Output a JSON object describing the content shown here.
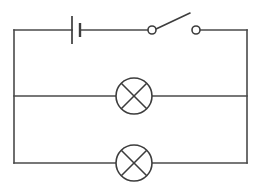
{
  "diagram": {
    "type": "electrical-schematic",
    "background_color": "#ffffff",
    "line_color": "#4a4a4a",
    "component_color": "#3d3d3d",
    "canvas": {
      "width": 262,
      "height": 185
    }
  },
  "geometry": {
    "loop": {
      "left": 14,
      "right": 247,
      "top": 30,
      "bottom": 163
    },
    "middle_branch_y": 96
  },
  "components": [
    {
      "id": "battery",
      "name": "battery-cell",
      "label": "Battery",
      "symbol": "single-cell",
      "x": 76,
      "y": 30,
      "long_plate_x": 72,
      "long_plate_half_height": 14,
      "short_plate_x": 80,
      "short_plate_half_height": 7
    },
    {
      "id": "switch",
      "name": "open-switch",
      "label": "Switch",
      "symbol": "spst-open",
      "state": "open",
      "left_terminal": {
        "x": 152,
        "y": 30,
        "r": 4
      },
      "right_terminal": {
        "x": 196,
        "y": 30,
        "r": 4
      },
      "lever_end": {
        "x": 190,
        "y": 13
      }
    },
    {
      "id": "lamp-1",
      "name": "lamp-upper",
      "label": "Lamp 1",
      "symbol": "lamp-cross-circle",
      "cx": 134,
      "cy": 96,
      "r": 18,
      "branch": "middle"
    },
    {
      "id": "lamp-2",
      "name": "lamp-lower",
      "label": "Lamp 2",
      "symbol": "lamp-cross-circle",
      "cx": 134,
      "cy": 163,
      "r": 18,
      "branch": "bottom"
    }
  ],
  "wires": [
    {
      "id": "top-rail-left",
      "name": "wire-top-left",
      "path": "M 14 30 L 72 30"
    },
    {
      "id": "top-rail-mid",
      "name": "wire-top-middle",
      "path": "M 80 30 L 148 30"
    },
    {
      "id": "top-rail-right",
      "name": "wire-top-right",
      "path": "M 200 30 L 247 30"
    },
    {
      "id": "left-rail",
      "name": "wire-left-rail",
      "path": "M 14 30 L 14 163"
    },
    {
      "id": "right-rail",
      "name": "wire-right-rail",
      "path": "M 247 30 L 247 163"
    },
    {
      "id": "mid-branch-left",
      "name": "wire-middle-left",
      "path": "M 14 96 L 116 96"
    },
    {
      "id": "mid-branch-right",
      "name": "wire-middle-right",
      "path": "M 152 96 L 247 96"
    },
    {
      "id": "bottom-left",
      "name": "wire-bottom-left",
      "path": "M 14 163 L 116 163"
    },
    {
      "id": "bottom-right",
      "name": "wire-bottom-right",
      "path": "M 152 163 L 247 163"
    }
  ]
}
